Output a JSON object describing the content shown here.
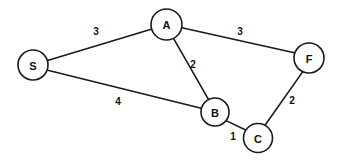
{
  "figure": {
    "type": "undirected-weighted-graph",
    "background_color": "#ffffff",
    "stroke_color": "#1a1a1a",
    "text_color": "#111111",
    "width": 338,
    "height": 162
  },
  "nodes": [
    {
      "id": "S",
      "label": "S",
      "cx": 33,
      "cy": 65,
      "r": 15.0
    },
    {
      "id": "A",
      "label": "A",
      "cx": 166.5,
      "cy": 24.5,
      "r": 15.5
    },
    {
      "id": "F",
      "label": "F",
      "cx": 309,
      "cy": 58,
      "r": 15.0
    },
    {
      "id": "B",
      "label": "B",
      "cx": 215,
      "cy": 112,
      "r": 14.0
    },
    {
      "id": "C",
      "label": "C",
      "cx": 258,
      "cy": 138,
      "r": 14.5
    }
  ],
  "edges": [
    {
      "id": "S-A",
      "from": "S",
      "to": "A",
      "weight": "3",
      "x1": 47.5,
      "y1": 60.6,
      "x2": 152.0,
      "y2": 29.0,
      "label_x": 96,
      "label_y": 31
    },
    {
      "id": "A-F",
      "from": "A",
      "to": "F",
      "weight": "3",
      "x1": 181.8,
      "y1": 27.8,
      "x2": 294.3,
      "y2": 52.8,
      "label_x": 240,
      "label_y": 31
    },
    {
      "id": "A-B",
      "from": "A",
      "to": "B",
      "weight": "2",
      "x1": 173.5,
      "y1": 38.3,
      "x2": 208.6,
      "y2": 99.7,
      "label_x": 193,
      "label_y": 64
    },
    {
      "id": "S-B",
      "from": "S",
      "to": "B",
      "weight": "4",
      "x1": 47.7,
      "y1": 70.2,
      "x2": 201.2,
      "y2": 108.3,
      "label_x": 118,
      "label_y": 101
    },
    {
      "id": "B-C",
      "from": "B",
      "to": "C",
      "weight": "1",
      "x1": 226.1,
      "y1": 120.6,
      "x2": 247.2,
      "y2": 130.8,
      "label_x": 233,
      "label_y": 136
    },
    {
      "id": "C-F",
      "from": "C",
      "to": "F",
      "weight": "2",
      "x1": 265.0,
      "y1": 125.3,
      "x2": 302.8,
      "y2": 71.6,
      "label_x": 292,
      "label_y": 100
    }
  ]
}
